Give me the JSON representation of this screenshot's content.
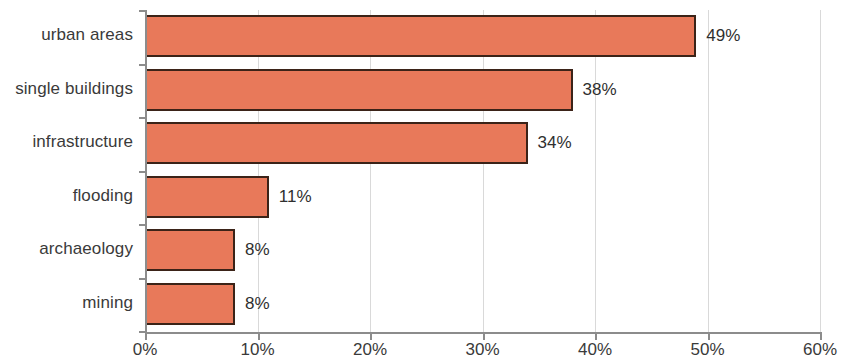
{
  "chart_data": {
    "type": "bar",
    "orientation": "horizontal",
    "title": "",
    "xlabel": "",
    "ylabel": "",
    "categories": [
      "urban areas",
      "single buildings",
      "infrastructure",
      "flooding",
      "archaeology",
      "mining"
    ],
    "values": [
      49,
      38,
      34,
      11,
      8,
      8
    ],
    "value_labels": [
      "49%",
      "38%",
      "34%",
      "11%",
      "8%",
      "8%"
    ],
    "xlim": [
      0,
      60
    ],
    "xticks": [
      0,
      10,
      20,
      30,
      40,
      50,
      60
    ],
    "xtick_labels": [
      "0%",
      "10%",
      "20%",
      "30%",
      "40%",
      "50%",
      "60%"
    ],
    "grid": "vertical",
    "legend": "none",
    "colors": {
      "bar_fill": "#e8795a",
      "bar_border": "#3b2318",
      "gridline": "#d9d9d9",
      "axis": "#8c8c8c",
      "text": "#3a3a3a",
      "background": "#ffffff"
    }
  }
}
